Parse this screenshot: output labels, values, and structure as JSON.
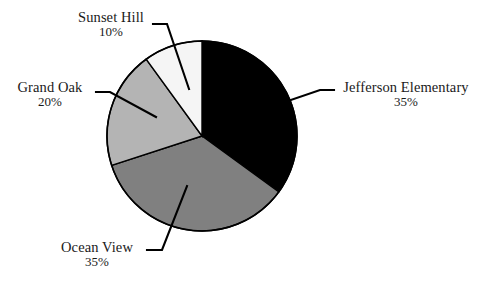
{
  "chart_data": {
    "type": "pie",
    "title": "",
    "subtitle": "",
    "xlabel": "",
    "ylabel": "",
    "legend_position": "none",
    "grid": false,
    "start_angle_deg": 0,
    "direction": "clockwise",
    "units": "percent",
    "categories": [
      "Jefferson Elementary",
      "Ocean View",
      "Grand Oak",
      "Sunset Hill"
    ],
    "values": [
      35,
      35,
      20,
      10
    ],
    "value_labels": [
      "35%",
      "35%",
      "20%",
      "10%"
    ],
    "colors": [
      "#000000",
      "#808080",
      "#b4b4b4",
      "#f5f5f5"
    ],
    "slices": [
      {
        "name": "Jefferson Elementary",
        "value": 35,
        "value_label": "35%",
        "color": "#000000",
        "start_deg": 0,
        "end_deg": 126,
        "label_position": "right"
      },
      {
        "name": "Ocean View",
        "value": 35,
        "value_label": "35%",
        "color": "#808080",
        "start_deg": 126,
        "end_deg": 252,
        "label_position": "bottom-left"
      },
      {
        "name": "Grand Oak",
        "value": 20,
        "value_label": "20%",
        "color": "#b4b4b4",
        "start_deg": 252,
        "end_deg": 324,
        "label_position": "left"
      },
      {
        "name": "Sunset Hill",
        "value": 10,
        "value_label": "10%",
        "color": "#f5f5f5",
        "start_deg": 324,
        "end_deg": 360,
        "label_position": "top"
      }
    ]
  },
  "labels": {
    "jefferson": {
      "name": "Jefferson Elementary",
      "value": "35%"
    },
    "ocean_view": {
      "name": "Ocean View",
      "value": "35%"
    },
    "grand_oak": {
      "name": "Grand Oak",
      "value": "20%"
    },
    "sunset_hill": {
      "name": "Sunset Hill",
      "value": "10%"
    }
  },
  "style": {
    "outline_color": "#000000",
    "background": "#ffffff",
    "leader_color": "#000000"
  }
}
